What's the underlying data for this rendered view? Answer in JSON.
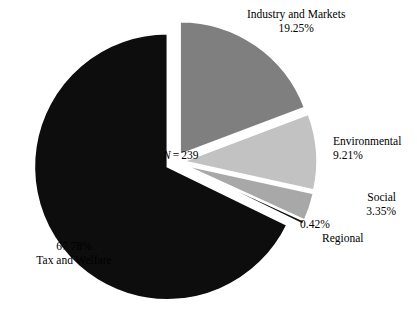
{
  "chart_data": {
    "type": "pie",
    "title": "",
    "subtitle": "",
    "xlabel": "",
    "ylabel": "",
    "legend_position": "none",
    "grid": false,
    "exploded": true,
    "start_angle_deg": -90,
    "direction": "clockwise",
    "total_label": "N = 239",
    "total_label_parts": {
      "variable": "N",
      "equals": "=",
      "value": "239"
    },
    "sample_size": 239,
    "categories": [
      "Industry and Markets",
      "Environmental",
      "Social",
      "Regional",
      "Tax and Welfare"
    ],
    "values": [
      19.25,
      9.21,
      3.35,
      0.42,
      67.78
    ],
    "units": "percent",
    "slices": [
      {
        "name": "Industry and Markets",
        "label": "Industry and Markets",
        "percent_text": "19.25%",
        "value": 19.25,
        "color": "#7f7f7f",
        "label_lines": [
          "Industry and Markets",
          "19.25%"
        ],
        "label_position": "top-right"
      },
      {
        "name": "Environmental",
        "label": "Environmental",
        "percent_text": "9.21%",
        "value": 9.21,
        "color": "#c2c2c2",
        "label_lines": [
          "Environmental",
          "9.21%"
        ],
        "label_position": "right"
      },
      {
        "name": "Social",
        "label": "Social",
        "percent_text": "3.35%",
        "value": 3.35,
        "color": "#a8a8a8",
        "label_lines": [
          "Social",
          "3.35%"
        ],
        "label_position": "lower-right"
      },
      {
        "name": "Regional",
        "label": "Regional",
        "percent_text": "0.42%",
        "value": 0.42,
        "color": "#121212",
        "label_lines": [
          "0.42%",
          "Regional"
        ],
        "label_position": "bottom-right"
      },
      {
        "name": "Tax and Welfare",
        "label": "Tax and Welfare",
        "percent_text": "67.78%",
        "value": 67.78,
        "color": "#0d0d0d",
        "label_lines": [
          "67.78%",
          "Tax and Welfare"
        ],
        "label_position": "lower-left"
      }
    ],
    "background_color": "#ffffff"
  },
  "labels": {
    "industry": {
      "name": "Industry and Markets",
      "percent": "19.25%"
    },
    "environmental": {
      "name": "Environmental",
      "percent": "9.21%"
    },
    "social": {
      "name": "Social",
      "percent": "3.35%"
    },
    "regional": {
      "name": "Regional",
      "percent": "0.42%"
    },
    "tax": {
      "name": "Tax and Welfare",
      "percent": "67.78%"
    },
    "n_variable": "N",
    "n_equals": "=",
    "n_value": "239"
  }
}
